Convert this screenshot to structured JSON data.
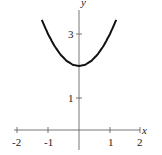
{
  "chart_data": {
    "type": "line",
    "title": "",
    "xlabel": "x",
    "ylabel": "y",
    "xlim": [
      -2.1,
      2.1
    ],
    "ylim": [
      0,
      3.9
    ],
    "x_ticks": [
      -2,
      -1,
      1,
      2
    ],
    "x_tick_labels": [
      "-2",
      "-1",
      "1",
      "2"
    ],
    "y_ticks": [
      1,
      3
    ],
    "y_tick_labels": [
      "1",
      "3"
    ],
    "grid": false,
    "legend": null,
    "series": [
      {
        "name": "y = x^2 + 2",
        "x": [
          -1.2,
          -1.0,
          -0.8,
          -0.6,
          -0.4,
          -0.2,
          0,
          0.2,
          0.4,
          0.6,
          0.8,
          1.0,
          1.2
        ],
        "values": [
          3.44,
          3.0,
          2.64,
          2.36,
          2.16,
          2.04,
          2.0,
          2.04,
          2.16,
          2.36,
          2.64,
          3.0,
          3.44
        ]
      }
    ],
    "colors": {
      "curve": "#111111",
      "axes": "#555555"
    }
  },
  "labels": {
    "x_axis": "x",
    "y_axis": "y",
    "x_ticks": [
      "-2",
      "-1",
      "1",
      "2"
    ],
    "y_ticks": [
      "1",
      "3"
    ]
  }
}
